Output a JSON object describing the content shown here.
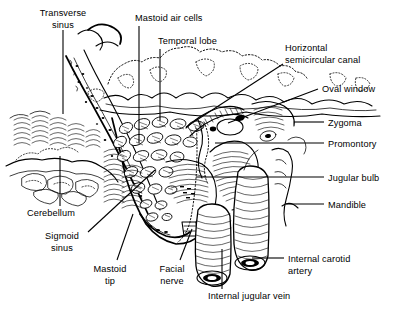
{
  "figure": {
    "kind": "anatomical-line-illustration",
    "background_color": "#ffffff",
    "ink_color": "#000000",
    "width": 400,
    "height": 311
  },
  "labels": [
    {
      "id": "transverse-sinus",
      "text": "Transverse sinus",
      "lines": [
        "Transverse",
        "sinus"
      ],
      "anchor": "middle",
      "x": 63,
      "y": 16,
      "line_height": 12
    },
    {
      "id": "mastoid-air-cells",
      "text": "Mastoid air cells",
      "lines": [
        "Mastoid air cells"
      ],
      "anchor": "start",
      "x": 135,
      "y": 21,
      "line_height": 12
    },
    {
      "id": "temporal-lobe",
      "text": "Temporal lobe",
      "lines": [
        "Temporal lobe"
      ],
      "anchor": "start",
      "x": 158,
      "y": 44,
      "line_height": 12
    },
    {
      "id": "horizontal-semicircular-canal",
      "text": "Horizontal semicircular canal",
      "lines": [
        "Horizontal",
        "semicircular canal"
      ],
      "anchor": "start",
      "x": 285,
      "y": 51,
      "line_height": 12
    },
    {
      "id": "oval-window",
      "text": "Oval window",
      "lines": [
        "Oval window"
      ],
      "anchor": "start",
      "x": 322,
      "y": 92,
      "line_height": 12
    },
    {
      "id": "zygoma",
      "text": "Zygoma",
      "lines": [
        "Zygoma"
      ],
      "anchor": "start",
      "x": 328,
      "y": 126,
      "line_height": 12
    },
    {
      "id": "promontory",
      "text": "Promontory",
      "lines": [
        "Promontory"
      ],
      "anchor": "start",
      "x": 328,
      "y": 147,
      "line_height": 12
    },
    {
      "id": "jugular-bulb",
      "text": "Jugular bulb",
      "lines": [
        "Jugular bulb"
      ],
      "anchor": "start",
      "x": 328,
      "y": 181,
      "line_height": 12
    },
    {
      "id": "mandible",
      "text": "Mandible",
      "lines": [
        "Mandible"
      ],
      "anchor": "start",
      "x": 328,
      "y": 208,
      "line_height": 12
    },
    {
      "id": "internal-carotid-artery",
      "text": "Internal carotid artery",
      "lines": [
        "Internal carotid",
        "artery"
      ],
      "anchor": "start",
      "x": 288,
      "y": 262,
      "line_height": 12
    },
    {
      "id": "internal-jugular-vein",
      "text": "Internal jugular vein",
      "lines": [
        "Internal jugular vein"
      ],
      "anchor": "start",
      "x": 208,
      "y": 299,
      "line_height": 12
    },
    {
      "id": "cerebellum",
      "text": "Cerebellum",
      "lines": [
        "Cerebellum"
      ],
      "anchor": "start",
      "x": 27,
      "y": 216,
      "line_height": 12
    },
    {
      "id": "sigmoid-sinus",
      "text": "Sigmoid sinus",
      "lines": [
        "Sigmoid",
        "sinus"
      ],
      "anchor": "middle",
      "x": 62,
      "y": 239,
      "line_height": 12
    },
    {
      "id": "mastoid-tip",
      "text": "Mastoid tip",
      "lines": [
        "Mastoid",
        "tip"
      ],
      "anchor": "middle",
      "x": 110,
      "y": 272,
      "line_height": 12
    },
    {
      "id": "facial-nerve",
      "text": "Facial nerve",
      "lines": [
        "Facial",
        "nerve"
      ],
      "anchor": "middle",
      "x": 172,
      "y": 272,
      "line_height": 12
    }
  ],
  "leaders": [
    {
      "id": "leader-transverse-sinus",
      "points": "63,30 63,114"
    },
    {
      "id": "leader-mastoid-air-cells",
      "points": "139,26 139,143"
    },
    {
      "id": "leader-temporal-lobe",
      "points": "160,49 160,121"
    },
    {
      "id": "leader-horizontal-semicircular-canal",
      "points": "283,64 186,127"
    },
    {
      "id": "leader-oval-window",
      "points": "318,89 228,123"
    },
    {
      "id": "leader-zygoma",
      "points": "324,122 294,122"
    },
    {
      "id": "leader-promontory",
      "points": "324,143 215,143"
    },
    {
      "id": "leader-jugular-bulb",
      "points": "324,177 196,177"
    },
    {
      "id": "leader-mandible",
      "points": "324,204 286,204"
    },
    {
      "id": "leader-internal-carotid-artery",
      "points": "284,258 252,258"
    },
    {
      "id": "leader-internal-jugular-vein",
      "points": "222,289 222,249"
    },
    {
      "id": "leader-cerebellum",
      "points": "60,206 60,156"
    },
    {
      "id": "leader-sigmoid-sinus",
      "points": "88,232 155,170"
    },
    {
      "id": "leader-mastoid-tip",
      "points": "117,260 133,214"
    },
    {
      "id": "leader-facial-nerve",
      "points": "180,260 192,229"
    }
  ]
}
